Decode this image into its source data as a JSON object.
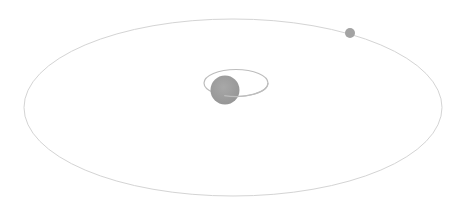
{
  "diagram": {
    "type": "orbital-system",
    "background": "#ffffff",
    "outer_orbit": {
      "cx": 233,
      "cy": 107.5,
      "rx": 209,
      "ry": 88.5,
      "stroke": "#d4d4d4",
      "stroke_width": 1
    },
    "inner_orbit": {
      "cx": 236,
      "cy": 83,
      "rx": 32,
      "ry": 13.5,
      "stroke": "#bdbdbd",
      "stroke_width": 1.2
    },
    "central_body": {
      "cx": 225,
      "cy": 90,
      "r": 14.5,
      "fill": "#9e9e9e"
    },
    "orbiting_body": {
      "cx": 350,
      "cy": 33,
      "r": 5,
      "fill": "#a3a3a3"
    }
  }
}
